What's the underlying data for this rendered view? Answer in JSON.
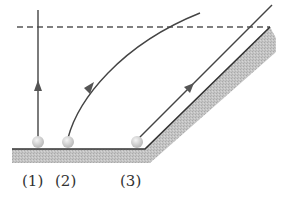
{
  "diagram": {
    "labels": [
      "(1)",
      "(2)",
      "(3)"
    ],
    "colors": {
      "line": "#444444",
      "ground_fill": "#bdbdbd",
      "ball": "#d9d9d9",
      "dashed": "#555555"
    }
  }
}
